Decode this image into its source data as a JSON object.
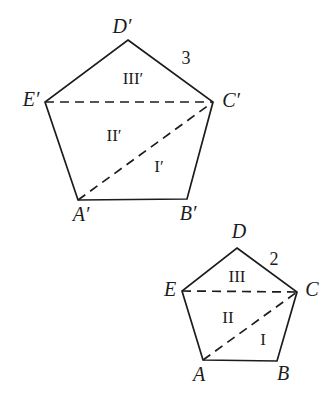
{
  "figure": {
    "background": "#ffffff",
    "stroke_color": "#1c1c1c",
    "stroke_width": 1.7,
    "dash_pattern": "9 6",
    "width": 329,
    "height": 402,
    "pentagons": [
      {
        "name": "pentagon-large-A-prime-B-prime-C-prime-D-prime-E-prime",
        "vertex_names": [
          "D'",
          "C'",
          "B'",
          "A'",
          "E'"
        ],
        "vertices": [
          [
            128,
            40
          ],
          [
            213,
            102
          ],
          [
            187,
            199
          ],
          [
            78,
            200
          ],
          [
            45,
            102
          ]
        ],
        "dashed_segments": [
          {
            "name": "dashed-diagonal-E-prime-C-prime",
            "from": [
              45,
              102
            ],
            "to": [
              213,
              102
            ]
          },
          {
            "name": "dashed-diagonal-A-prime-C-prime",
            "from": [
              78,
              200
            ],
            "to": [
              213,
              102
            ]
          }
        ],
        "labels": [
          {
            "name": "vertex-label-D-prime",
            "text": "D′",
            "x": 122,
            "y": 26,
            "kind": "vertex"
          },
          {
            "name": "vertex-label-E-prime",
            "text": "E′",
            "x": 31,
            "y": 99,
            "kind": "vertex"
          },
          {
            "name": "vertex-label-C-prime",
            "text": "C′",
            "x": 231,
            "y": 100,
            "kind": "vertex"
          },
          {
            "name": "vertex-label-A-prime",
            "text": "A′",
            "x": 81,
            "y": 214,
            "kind": "vertex"
          },
          {
            "name": "vertex-label-B-prime",
            "text": "B′",
            "x": 188,
            "y": 213,
            "kind": "vertex"
          },
          {
            "name": "side-length-label-3",
            "text": "3",
            "x": 186,
            "y": 58,
            "kind": "side"
          },
          {
            "name": "region-label-III-prime",
            "text": "III′",
            "x": 133,
            "y": 78,
            "kind": "region"
          },
          {
            "name": "region-label-II-prime",
            "text": "II′",
            "x": 114,
            "y": 135,
            "kind": "region"
          },
          {
            "name": "region-label-I-prime",
            "text": "I′",
            "x": 159,
            "y": 166,
            "kind": "region"
          }
        ]
      },
      {
        "name": "pentagon-small-A-B-C-D-E",
        "vertex_names": [
          "D",
          "C",
          "B",
          "A",
          "E"
        ],
        "vertices": [
          [
            237,
            248
          ],
          [
            297,
            292
          ],
          [
            277,
            361
          ],
          [
            203,
            360
          ],
          [
            182,
            291
          ]
        ],
        "dashed_segments": [
          {
            "name": "dashed-diagonal-E-C",
            "from": [
              182,
              291
            ],
            "to": [
              297,
              292
            ]
          },
          {
            "name": "dashed-diagonal-A-C",
            "from": [
              203,
              360
            ],
            "to": [
              297,
              292
            ]
          }
        ],
        "labels": [
          {
            "name": "vertex-label-D",
            "text": "D",
            "x": 239,
            "y": 231,
            "kind": "vertex"
          },
          {
            "name": "vertex-label-E",
            "text": "E",
            "x": 170,
            "y": 289,
            "kind": "vertex"
          },
          {
            "name": "vertex-label-C",
            "text": "C",
            "x": 312,
            "y": 289,
            "kind": "vertex"
          },
          {
            "name": "vertex-label-A",
            "text": "A",
            "x": 199,
            "y": 374,
            "kind": "vertex"
          },
          {
            "name": "vertex-label-B",
            "text": "B",
            "x": 283,
            "y": 373,
            "kind": "vertex"
          },
          {
            "name": "side-length-label-2",
            "text": "2",
            "x": 274,
            "y": 259,
            "kind": "side"
          },
          {
            "name": "region-label-III",
            "text": "III",
            "x": 237,
            "y": 276,
            "kind": "region"
          },
          {
            "name": "region-label-II",
            "text": "II",
            "x": 228,
            "y": 317,
            "kind": "region"
          },
          {
            "name": "region-label-I",
            "text": "I",
            "x": 263,
            "y": 339,
            "kind": "region"
          }
        ]
      }
    ]
  }
}
